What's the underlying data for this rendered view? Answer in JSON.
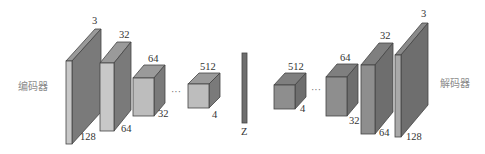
{
  "diagram": {
    "type": "autoencoder-architecture",
    "encoder_label": "编码器",
    "decoder_label": "解码器",
    "latent_label": "Z",
    "ellipsis": "···",
    "colors": {
      "front_light": "#c8c8c8",
      "front_mid": "#a9a9a9",
      "side_dark": "#7a7a7a",
      "top": "#9a9a9a",
      "latent": "#6e6e6e",
      "outline": "#444444"
    },
    "encoder_blocks": [
      {
        "depth_label": "3",
        "height_label": "128",
        "width_label": ""
      },
      {
        "depth_label": "32",
        "height_label": "64",
        "width_label": ""
      },
      {
        "depth_label": "64",
        "height_label": "32",
        "width_label": ""
      },
      {
        "depth_label": "512",
        "height_label": "4",
        "width_label": ""
      }
    ],
    "decoder_blocks": [
      {
        "depth_label": "512",
        "height_label": "4"
      },
      {
        "depth_label": "64",
        "height_label": "32"
      },
      {
        "depth_label": "32",
        "height_label": "64"
      },
      {
        "depth_label": "3",
        "height_label": "128"
      }
    ]
  }
}
